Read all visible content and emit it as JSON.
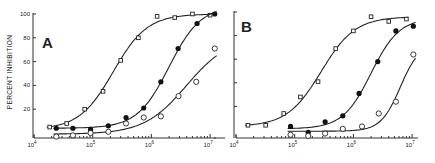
{
  "figure": {
    "y_axis_label": "PERCENT INHIBITION"
  },
  "chart_data": [
    {
      "type": "scatter",
      "panel": "A",
      "title": "A",
      "xlabel": "",
      "ylabel": "PERCENT INHIBITION",
      "xscale": "log",
      "xlim": [
        10000,
        10000000
      ],
      "ylim": [
        0,
        100
      ],
      "x_tick_labels": [
        "10^4",
        "10^5",
        "10^6",
        "10^7"
      ],
      "y_tick_labels": [
        "20",
        "40",
        "60",
        "80",
        "100"
      ],
      "grid": false,
      "legend": null,
      "fitted_curves": true,
      "series": [
        {
          "name": "open-square",
          "marker": "open-square",
          "x": [
            18500,
            36000,
            73000,
            150000,
            300000,
            600000,
            1250000,
            2500000,
            5000000,
            10000000
          ],
          "y": [
            5,
            8,
            20,
            35,
            61,
            80,
            98,
            97,
            100,
            99
          ]
        },
        {
          "name": "filled-circle",
          "marker": "filled-circle",
          "x": [
            24000,
            46000,
            92000,
            185000,
            370000,
            740000,
            1450000,
            2850000,
            6000000,
            12000000
          ],
          "y": [
            4,
            4,
            3,
            6,
            13,
            21,
            43,
            71,
            92,
            100
          ]
        },
        {
          "name": "open-circle",
          "marker": "open-circle",
          "x": [
            24000,
            46000,
            92000,
            185000,
            370000,
            740000,
            1450000,
            2900000,
            5800000,
            12000000
          ],
          "y": [
            -3,
            -2,
            0,
            1,
            8,
            13,
            14,
            31,
            43,
            71
          ]
        }
      ]
    },
    {
      "type": "scatter",
      "panel": "B",
      "title": "B",
      "xlabel": "",
      "ylabel": "",
      "xscale": "log",
      "xlim": [
        10000,
        10000000
      ],
      "ylim": [
        0,
        100
      ],
      "x_tick_labels": [
        "10^4",
        "10^5",
        "10^6",
        "10^7"
      ],
      "y_tick_labels": [],
      "grid": false,
      "legend": null,
      "fitted_curves": true,
      "series": [
        {
          "name": "open-square",
          "marker": "open-square",
          "x": [
            16000,
            32000,
            65000,
            125000,
            250000,
            500000,
            1000000,
            2000000,
            4000000,
            8000000
          ],
          "y": [
            4,
            4,
            14,
            28,
            41,
            69,
            84,
            96,
            92,
            94
          ]
        },
        {
          "name": "filled-circle",
          "marker": "filled-circle",
          "x": [
            85000,
            170000,
            330000,
            660000,
            1250000,
            2600000,
            5300000,
            10500000
          ],
          "y": [
            3,
            -2,
            7,
            12,
            31,
            58,
            84,
            88
          ]
        },
        {
          "name": "open-circle",
          "marker": "open-circle",
          "x": [
            85000,
            170000,
            330000,
            660000,
            1400000,
            2700000,
            5300000,
            10500000
          ],
          "y": [
            -4,
            -5,
            -3,
            1,
            3,
            14,
            24,
            64
          ]
        }
      ]
    }
  ]
}
